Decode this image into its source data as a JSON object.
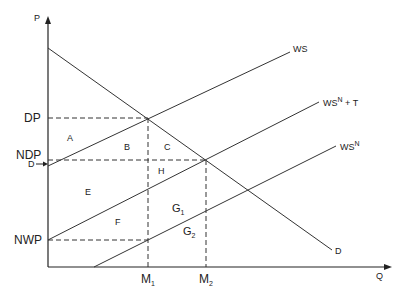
{
  "diagram": {
    "axes": {
      "y_label": "P",
      "x_label": "Q"
    },
    "price_levels": [
      {
        "label": "DP",
        "y": 118
      },
      {
        "label": "NDP",
        "y": 160
      },
      {
        "label": "NWP",
        "y": 240
      }
    ],
    "quantity_levels": [
      {
        "label": "M",
        "sub": "1",
        "x": 148
      },
      {
        "label": "M",
        "sub": "2",
        "x": 206
      }
    ],
    "curves": [
      {
        "name": "WS",
        "label": "WS"
      },
      {
        "name": "WSN+T",
        "label": "WS",
        "sup": "N",
        "suffix": " + T"
      },
      {
        "name": "WSN",
        "label": "WS",
        "sup": "N"
      },
      {
        "name": "D",
        "label": "D"
      }
    ],
    "d_marker": "D",
    "areas": {
      "A": "A",
      "B": "B",
      "C": "C",
      "E": "E",
      "H": "H",
      "F": "F",
      "G1": "G",
      "G1_sub": "1",
      "G2": "G",
      "G2_sub": "2"
    }
  }
}
